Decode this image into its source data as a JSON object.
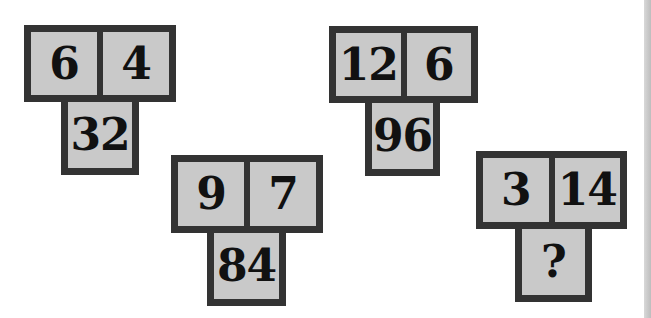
{
  "puzzle": {
    "groups": [
      {
        "a": "6",
        "b": "4",
        "result": "32"
      },
      {
        "a": "9",
        "b": "7",
        "result": "84"
      },
      {
        "a": "12",
        "b": "6",
        "result": "96"
      },
      {
        "a": "3",
        "b": "14",
        "result": "?"
      }
    ]
  },
  "colors": {
    "border": "#333333",
    "cell_fill": "#c9c9c9",
    "digit": "#111111",
    "background": "#ffffff"
  }
}
